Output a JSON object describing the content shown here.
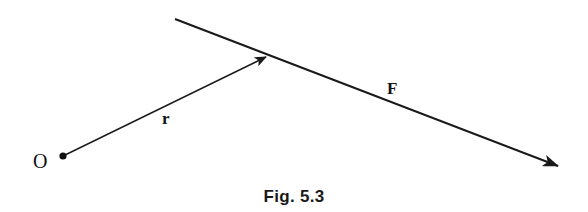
{
  "figure": {
    "caption": "Fig. 5.3",
    "origin": {
      "label": "O",
      "x": 63,
      "y": 156
    },
    "vectors": [
      {
        "name": "r",
        "label": "r",
        "from": [
          63,
          156
        ],
        "to": [
          266,
          57
        ],
        "label_pos": [
          166,
          121
        ],
        "bold": true
      },
      {
        "name": "F",
        "label": "F",
        "from": [
          175,
          19
        ],
        "to": [
          558,
          166
        ],
        "label_pos": [
          393,
          92
        ],
        "bold": true
      }
    ],
    "colors": {
      "stroke": "#1a1a1a",
      "background": "#ffffff"
    }
  }
}
